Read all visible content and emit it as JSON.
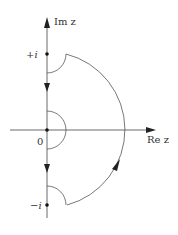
{
  "diagram": {
    "axes": {
      "imag_label": "Im z",
      "real_label": "Re z"
    },
    "points": {
      "plus_i": "+i",
      "origin": "0",
      "minus_i": "−i"
    },
    "colors": {
      "line": "#555555",
      "axis": "#444444",
      "text": "#333333"
    }
  }
}
